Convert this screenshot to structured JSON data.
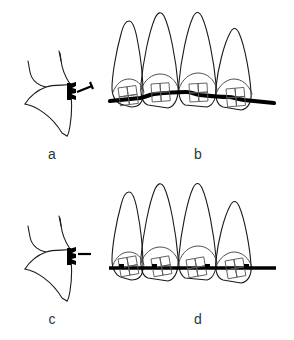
{
  "figure": {
    "background_color": "#ffffff",
    "line_color": "#1a1a1a",
    "wire_color": "#000000",
    "width": 294,
    "height": 340
  },
  "panels": [
    {
      "id": "a",
      "label": "a",
      "caption_position": "below-center",
      "content": "single tooth side view with bracket and angled wire segment",
      "tooth_count": 1,
      "view": "proximal-cross-section",
      "bracket": {
        "count": 1,
        "position": "labial-surface",
        "fill": "#000000",
        "wire": {
          "orientation": "angled",
          "style": "short-stub"
        }
      }
    },
    {
      "id": "b",
      "label": "b",
      "caption_position": "below-center",
      "content": "four teeth frontal view with brackets and wavy archwire",
      "tooth_count": 4,
      "view": "frontal",
      "bracket": {
        "count": 4,
        "grid": "2x2",
        "position": "crown-center",
        "fill": "none",
        "stroke": "#5a5a5a"
      },
      "archwire": {
        "shape": "wavy",
        "thickness": "thick",
        "color": "#000000"
      }
    },
    {
      "id": "c",
      "label": "c",
      "caption_position": "below-center",
      "content": "single tooth side view with bracket and horizontal wire segment",
      "tooth_count": 1,
      "view": "proximal-cross-section",
      "bracket": {
        "count": 1,
        "position": "labial-surface",
        "fill": "#000000",
        "wire": {
          "orientation": "horizontal",
          "style": "short-stub"
        }
      }
    },
    {
      "id": "d",
      "label": "d",
      "caption_position": "below-center",
      "content": "four teeth frontal view with brackets, marker dots and straight archwire",
      "tooth_count": 4,
      "view": "frontal",
      "bracket": {
        "count": 4,
        "grid": "2x2",
        "position": "crown-center",
        "fill": "none",
        "stroke": "#5a5a5a",
        "marker_dot": {
          "present": true,
          "count": 4,
          "color": "#000000"
        }
      },
      "archwire": {
        "shape": "straight",
        "thickness": "thick",
        "color": "#000000"
      }
    }
  ],
  "labels": {
    "a": "a",
    "b": "b",
    "c": "c",
    "d": "d"
  }
}
